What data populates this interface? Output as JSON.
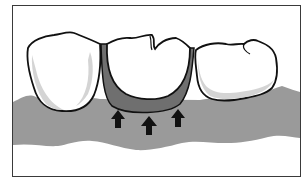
{
  "figure": {
    "caption_fragment": "",
    "colors": {
      "background": "#ffffff",
      "frame": "#3a3a3a",
      "gum": "#9a9a9a",
      "gum_dark": "#6f6f6f",
      "tooth": "#ffffff",
      "tooth_shadow": "#cfcfcf",
      "outline": "#111111",
      "arrow": "#111111"
    },
    "elements": {
      "teeth": [
        {
          "name": "left-tooth"
        },
        {
          "name": "center-pontic"
        },
        {
          "name": "right-tooth"
        }
      ],
      "arrows": [
        {
          "name": "arrow-left",
          "direction": "up"
        },
        {
          "name": "arrow-center",
          "direction": "up"
        },
        {
          "name": "arrow-right",
          "direction": "up"
        }
      ]
    }
  }
}
